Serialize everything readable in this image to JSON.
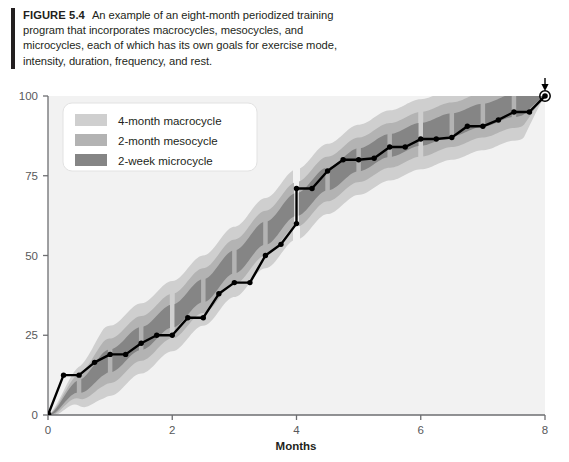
{
  "figure": {
    "label": "FIGURE 5.4",
    "caption": "An example of an eight-month periodized training program that incorporates macrocycles, mesocycles, and microcycles, each of which has its own goals for exercise mode, intensity, duration, frequency, and rest."
  },
  "legend": {
    "items": [
      {
        "label": "4-month macrocycle",
        "color": "#cfcfcf"
      },
      {
        "label": "2-month mesocycle",
        "color": "#b3b3b3"
      },
      {
        "label": "2-week microcycle",
        "color": "#858585"
      }
    ]
  },
  "annotation": {
    "goal_label": "Goal"
  },
  "colors": {
    "macrocycle": "#cfcfcf",
    "mesocycle": "#b3b3b3",
    "microcycle": "#858585",
    "line": "#000000",
    "axis": "#6d6e71",
    "plot_bg": "#f2f2f2"
  },
  "chart_data": {
    "type": "line",
    "title": "",
    "xlabel": "Months",
    "ylabel": "",
    "xlim": [
      0,
      8
    ],
    "ylim": [
      0,
      100
    ],
    "xticks": [
      0,
      2,
      4,
      6,
      8
    ],
    "xticklabels": [
      "0",
      "2",
      "4",
      "6",
      "8"
    ],
    "yticks": [
      0,
      25,
      50,
      75,
      100
    ],
    "yticklabels": [
      "0",
      "25",
      "50",
      "75",
      "100"
    ],
    "grid": false,
    "legend_position": "upper-left-inside",
    "series": [
      {
        "name": "Training load progression",
        "x": [
          0.0,
          0.25,
          0.5,
          0.75,
          1.0,
          1.25,
          1.5,
          1.75,
          2.0,
          2.25,
          2.5,
          2.75,
          3.0,
          3.25,
          3.5,
          3.75,
          4.0,
          4.0,
          4.25,
          4.5,
          4.75,
          5.0,
          5.25,
          5.5,
          5.75,
          6.0,
          6.25,
          6.5,
          6.75,
          7.0,
          7.25,
          7.5,
          7.75,
          8.0
        ],
        "y": [
          0.0,
          12.5,
          12.5,
          16.5,
          19.0,
          19.0,
          22.5,
          25.0,
          25.0,
          30.5,
          30.5,
          38.0,
          41.5,
          41.5,
          50.0,
          53.5,
          60.0,
          71.0,
          71.0,
          76.5,
          80.0,
          80.0,
          80.5,
          84.0,
          84.0,
          86.5,
          86.5,
          87.0,
          90.5,
          90.5,
          92.5,
          95.0,
          95.0,
          100.0
        ]
      }
    ],
    "bands": {
      "description": "Three nested shaded bands centred on the progression curve, widest for the macrocycle and narrowest for the microcycle",
      "center_x": [
        0,
        0.5,
        1,
        1.5,
        2,
        2.5,
        3,
        3.5,
        4,
        4.5,
        5,
        5.5,
        6,
        6.5,
        7,
        7.5,
        8
      ],
      "center_y": [
        0,
        9,
        17,
        24,
        31,
        39,
        48,
        57,
        66,
        74,
        80,
        84.5,
        88,
        91,
        94,
        97,
        100
      ],
      "macrocycle_halfwidth": 11.0,
      "mesocycle_halfwidth": 7.0,
      "microcycle_halfwidth": 3.6
    },
    "cycle_boundaries": {
      "macrocycle_months": [
        0,
        4,
        8
      ],
      "mesocycle_months": [
        0,
        2,
        4,
        6,
        8
      ],
      "microcycle_months": 0.5
    },
    "goal_point": {
      "x": 8,
      "y": 100
    }
  }
}
